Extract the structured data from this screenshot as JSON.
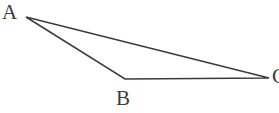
{
  "figure": {
    "type": "geometry-diagram",
    "shape": "triangle",
    "width": 279,
    "height": 113,
    "background_color": "#ffffff",
    "stroke_color": "#3a3a42",
    "stroke_width": 1.5,
    "label_color": "#3c3c44",
    "vertices": [
      {
        "name": "A",
        "label": "A",
        "x": 26,
        "y": 17,
        "label_x": 2,
        "label_y": 2
      },
      {
        "name": "B",
        "label": "B",
        "x": 125,
        "y": 79,
        "label_x": 116,
        "label_y": 88
      },
      {
        "name": "C",
        "label": "C",
        "x": 269,
        "y": 78,
        "label_x": 272,
        "label_y": 66,
        "clipped": true
      }
    ],
    "edges": [
      {
        "name": "AB",
        "from": "A",
        "to": "B"
      },
      {
        "name": "BC",
        "from": "B",
        "to": "C"
      },
      {
        "name": "CA",
        "from": "C",
        "to": "A"
      }
    ],
    "path": "M 26 17 L 125 79 L 269 78 Z"
  }
}
